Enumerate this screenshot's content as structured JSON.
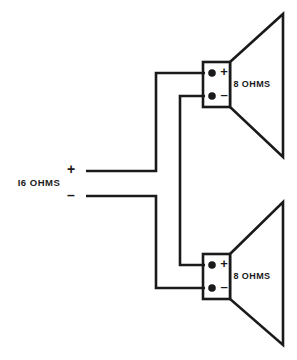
{
  "diagram": {
    "type": "schematic",
    "background_color": "#ffffff",
    "line_color": "#1a1a1a",
    "input": {
      "impedance_label": "I6 OHMS",
      "positive_sign": "+",
      "negative_sign": "–"
    },
    "speakers": [
      {
        "id": "top",
        "impedance_label": "8 OHMS",
        "positive_sign": "+",
        "negative_sign": "–"
      },
      {
        "id": "bottom",
        "impedance_label": "8 OHMS",
        "positive_sign": "+",
        "negative_sign": "–"
      }
    ]
  }
}
